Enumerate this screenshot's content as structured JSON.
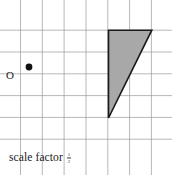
{
  "figure": {
    "width": 172,
    "height": 175,
    "background": "#ffffff"
  },
  "grid": {
    "line_color": "#9a9a9a",
    "line_width": 0.7,
    "spacing": 21.8,
    "x_lines": [
      20.5,
      42.3,
      64.1,
      86.0,
      107.8,
      129.6,
      151.4
    ],
    "y_lines": [
      30.2,
      52.0,
      73.8,
      95.6,
      117.4,
      139.2
    ],
    "visible": true
  },
  "center_of_enlargement": {
    "label": "O",
    "dot_x": 29,
    "dot_y": 67,
    "dot_radius": 3.4,
    "dot_color": "#111111",
    "label_x": 6,
    "label_y": 70
  },
  "shape": {
    "name": "shaded-triangle",
    "type": "triangle",
    "fill": "#a8a8a8",
    "stroke": "#1a1a1a",
    "stroke_width": 1.6,
    "points": "108.5,30.2 151.8,30.2 108.5,118.0",
    "vertices": [
      {
        "x": 108.5,
        "y": 30.2
      },
      {
        "x": 151.8,
        "y": 30.2
      },
      {
        "x": 108.5,
        "y": 118.0
      }
    ]
  },
  "annotation": {
    "scale_factor_label": "scale factor",
    "scale_factor_value": {
      "numerator": "1",
      "denominator": "2"
    }
  }
}
